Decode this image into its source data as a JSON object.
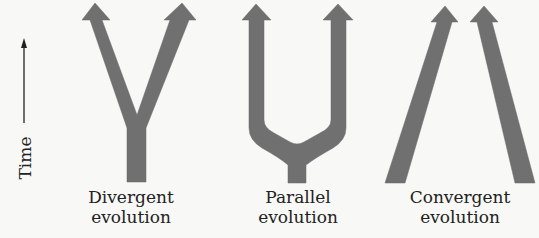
{
  "colors": {
    "background": "#f8f8f6",
    "arrow": "#707070",
    "text": "#222222"
  },
  "time_axis": {
    "label": "Time",
    "direction": "up"
  },
  "panels": [
    {
      "id": "divergent",
      "shape": "Y",
      "label_line1": "Divergent",
      "label_line2": "evolution"
    },
    {
      "id": "parallel",
      "shape": "U-fork",
      "label_line1": "Parallel",
      "label_line2": "evolution"
    },
    {
      "id": "convergent",
      "shape": "two-converging-lines",
      "label_line1": "Convergent",
      "label_line2": "evolution"
    }
  ],
  "geometry": {
    "divergent_path": "M127,182 L127,128 L90,20 L82,20 L95,3 L110,20 L102,20 L137,115 L170,20 L164,20 L182,3 L196,20 L189,20 L146,128 L146,182 Z",
    "parallel_path": "M288,183 L288,165 Q280,158 262,148 Q249,140 249,128 L249,20 L242,20 L256,4 L271,20 L264,20 L264,120 Q264,128 274,133 L290,142 Q297,146 304,142 L320,133 Q331,128 331,120 L331,20 L323,20 L338,4 L353,20 L346,20 L346,128 Q346,140 333,148 Q315,158 306,165 L306,183 Z",
    "convergent_left_path": "M385,183 L437,22 L431,22 L445,6 L458,22 L452,22 L405,183 Z",
    "convergent_right_path": "M535,183 L492,22 L498,22 L484,6 L470,22 L477,22 L515,183 Z",
    "time_arrow": {
      "x": 24,
      "y_top": 40,
      "y_bottom": 123
    }
  }
}
